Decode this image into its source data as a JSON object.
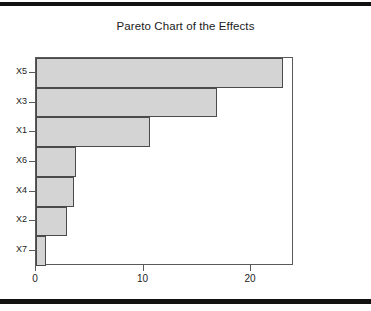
{
  "figure": {
    "background_color": "#ffffff",
    "edge_band_color": "#111111"
  },
  "chart_data": {
    "type": "bar",
    "orientation": "horizontal",
    "title": "Pareto Chart of the Effects",
    "xlabel": "",
    "ylabel": "",
    "categories": [
      "X5",
      "X3",
      "X1",
      "X6",
      "X4",
      "X2",
      "X7"
    ],
    "values": [
      23.0,
      16.8,
      10.6,
      3.7,
      3.5,
      2.9,
      0.9
    ],
    "xlim": [
      0,
      24
    ],
    "xticks": [
      0,
      10,
      20
    ],
    "xticklabels": [
      "0",
      "10",
      "20"
    ],
    "yticklabels": [
      "X5",
      "X3",
      "X1",
      "X6",
      "X4",
      "X2",
      "X7"
    ],
    "grid": false,
    "legend": null,
    "bar_fill_color": "#d4d4d4",
    "bar_edge_color": "#4a4a4a",
    "axis_color": "#5a5a5a"
  }
}
